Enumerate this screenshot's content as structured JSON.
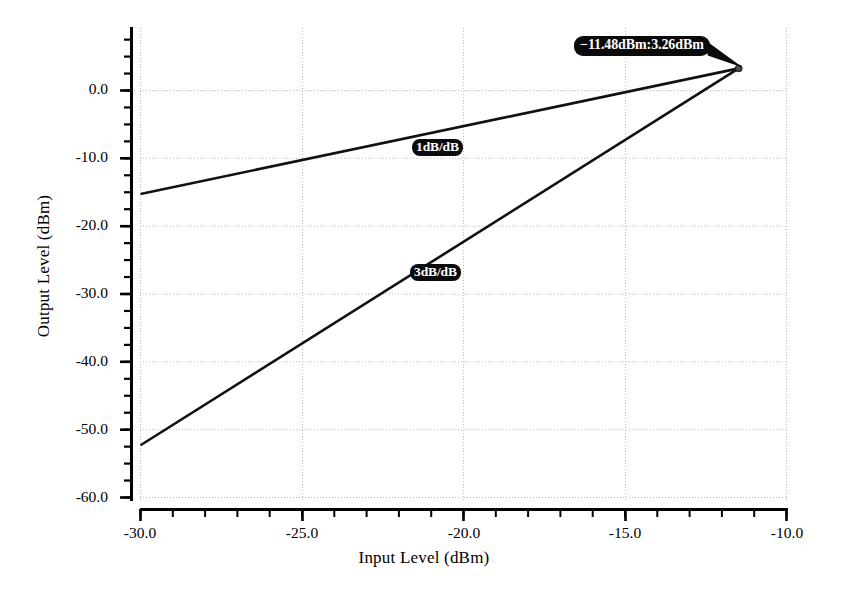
{
  "chart_data": {
    "type": "line",
    "title": "",
    "xlabel": "Input Level (dBm)",
    "ylabel": "Output Level (dBm)",
    "xlim": [
      -30.0,
      -10.0
    ],
    "ylim": [
      -60.0,
      9.4
    ],
    "grid": true,
    "legend": "none",
    "xticks": [
      "-30.0",
      "-25.0",
      "-20.0",
      "-15.0",
      "-10.0"
    ],
    "xtick_values": [
      -30.0,
      -25.0,
      -20.0,
      -15.0,
      -10.0
    ],
    "xtick_minor_step": 1.0,
    "yticks": [
      "0.0",
      "-10.0",
      "-20.0",
      "-30.0",
      "-40.0",
      "-50.0",
      "-60.0"
    ],
    "ytick_values": [
      0.0,
      -10.0,
      -20.0,
      -30.0,
      -40.0,
      -50.0,
      -60.0
    ],
    "ytick_minor_step": 2.5,
    "series": [
      {
        "name": "1dB/dB",
        "slope": 1,
        "x": [
          -30.0,
          -11.48
        ],
        "y": [
          -15.26,
          3.26
        ]
      },
      {
        "name": "3dB/dB",
        "slope": 3,
        "x": [
          -30.0,
          -11.48
        ],
        "y": [
          -52.3,
          3.26
        ]
      }
    ],
    "annotations": [
      {
        "name": "intercept-label",
        "text": "−11.48dBm:3.26dBm",
        "x": -11.48,
        "y": 3.26
      },
      {
        "name": "fundamental-slope-label",
        "text": "1dB/dB",
        "x": -20.7,
        "y": -7.0
      },
      {
        "name": "third-order-slope-label",
        "text": "3dB/dB",
        "x": -20.75,
        "y": -26.0
      }
    ],
    "markers": [
      {
        "name": "intercept-point",
        "x": -11.48,
        "y": 3.26
      }
    ],
    "colors": {
      "line": "#111111",
      "grid": "#bdbdbd",
      "axis": "#000000",
      "annotation_bg": "#0b0b0b",
      "annotation_text": "#ffffff",
      "background": "#ffffff"
    }
  }
}
